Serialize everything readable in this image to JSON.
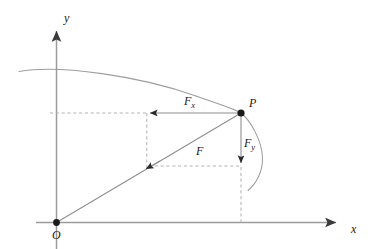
{
  "figure": {
    "type": "vector-decomposition-diagram",
    "colors": {
      "axis": "#8a8a8a",
      "curve": "#9a9a9a",
      "vector": "#8a8a8a",
      "dashed": "#b0b0b0",
      "point": "#1a1a1a",
      "text": "#1a1a1a",
      "background": "#ffffff"
    },
    "axes": {
      "x_label": "x",
      "y_label": "y",
      "origin_label": "O"
    },
    "points": [
      {
        "name": "origin",
        "label": "O",
        "x": 56,
        "y": 222
      },
      {
        "name": "point-p",
        "label": "P",
        "x": 241,
        "y": 113
      }
    ],
    "vectors": [
      {
        "name": "force-x-component",
        "label": "F",
        "subscript": "x",
        "from_x": 241,
        "from_y": 113,
        "to_x": 148,
        "to_y": 113
      },
      {
        "name": "force-y-component",
        "label": "F",
        "subscript": "y",
        "from_x": 241,
        "from_y": 113,
        "to_x": 241,
        "to_y": 166
      },
      {
        "name": "force-resultant",
        "label": "F",
        "subscript": "",
        "from_x": 241,
        "from_y": 113,
        "to_x": 146,
        "to_y": 166
      }
    ],
    "labels": {
      "fx": "F",
      "fx_sub": "x",
      "fy": "F",
      "fy_sub": "y",
      "f": "F",
      "p": "P",
      "o": "O",
      "x_axis": "x",
      "y_axis": "y"
    },
    "curve": {
      "name": "trajectory-curve",
      "description": "arc passing through point P"
    },
    "dashed_guides": [
      {
        "name": "horizontal-guide-upper",
        "x1": 50,
        "y1": 113,
        "x2": 147,
        "y2": 113
      },
      {
        "name": "vertical-guide-left",
        "x1": 147,
        "y1": 113,
        "x2": 147,
        "y2": 168
      },
      {
        "name": "horizontal-guide-lower",
        "x1": 148,
        "y1": 166,
        "x2": 241,
        "y2": 166
      },
      {
        "name": "vertical-guide-right",
        "x1": 241,
        "y1": 166,
        "x2": 241,
        "y2": 224
      }
    ]
  }
}
